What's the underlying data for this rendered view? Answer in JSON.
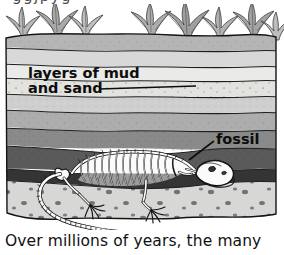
{
  "figure": {
    "alt_name": "fossil-formation-cross-section",
    "clipped_header_text": "ggjpyg",
    "labels": [
      {
        "id": "layers-label-line1",
        "text": "layers of mud"
      },
      {
        "id": "layers-label-line2",
        "text": "and sand"
      },
      {
        "id": "fossil-label",
        "text": "fossil"
      }
    ],
    "colors": {
      "page_background": "#ffffff",
      "outline": "#1a1a1a",
      "vegetation_light": "#c9c9c9",
      "vegetation_mid": "#a6a6a6",
      "vegetation_dark": "#8f8f8f",
      "stratum_1": "#b5b5b5",
      "stratum_2": "#d8d8d8",
      "stratum_3": "#e6e6e4",
      "stratum_4": "#cfcfcf",
      "stratum_5": "#b0b0b0",
      "stratum_6": "#9a9a9a",
      "stratum_7": "#7b7b7b",
      "stratum_8": "#5e5e5e",
      "stratum_9": "#3c3c3c",
      "sand_layer": "#d5d5d3",
      "pebble": "#6e6e6e",
      "bone_fill": "#fbfbfb",
      "label_text": "#0d0d0d",
      "caption_text": "#111111"
    },
    "elements": [
      {
        "id": "vegetation",
        "name": "fern-plants-row"
      },
      {
        "id": "strata",
        "name": "sediment-layers"
      },
      {
        "id": "skeleton",
        "name": "reptile-fossil-skeleton"
      },
      {
        "id": "sand",
        "name": "speckled-sand-bed"
      }
    ]
  },
  "caption": {
    "text": "Over millions of years, the many"
  }
}
